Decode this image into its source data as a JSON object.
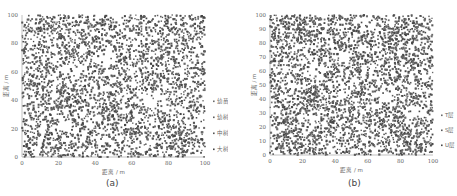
{
  "chart_data": [
    {
      "type": "scatter",
      "panel": "(a)",
      "title": "",
      "xlabel": "距离 / m",
      "ylabel": "距离 / m",
      "xlim": [
        0,
        100
      ],
      "ylim": [
        0,
        100
      ],
      "xticks": [
        "0",
        "20",
        "40",
        "60",
        "80",
        "100"
      ],
      "yticks": [
        "0",
        "20",
        "40",
        "60",
        "80",
        "100"
      ],
      "grid": false,
      "legend_position": "right",
      "series": [
        {
          "name": "幼苗",
          "color": "#6b6b6b"
        },
        {
          "name": "幼树",
          "color": "#5e5e5e"
        },
        {
          "name": "中树",
          "color": "#555555"
        },
        {
          "name": "大树",
          "color": "#444444"
        }
      ],
      "point_count_approx": 3200,
      "dense_regions": [
        {
          "x": 20,
          "y": 90,
          "r": 12
        },
        {
          "x": 80,
          "y": 85,
          "r": 14
        },
        {
          "x": 25,
          "y": 40,
          "r": 12
        },
        {
          "x": 45,
          "y": 30,
          "r": 12
        },
        {
          "x": 10,
          "y": 10,
          "r": 12
        },
        {
          "x": 85,
          "y": 10,
          "r": 12
        }
      ],
      "sparse_regions": [
        {
          "x": 28,
          "y": 60,
          "r": 8
        },
        {
          "x": 45,
          "y": 70,
          "r": 7
        },
        {
          "x": 72,
          "y": 40,
          "r": 8
        },
        {
          "x": 88,
          "y": 30,
          "r": 8
        },
        {
          "x": 25,
          "y": 20,
          "r": 6
        }
      ]
    },
    {
      "type": "scatter",
      "panel": "(b)",
      "title": "",
      "xlabel": "距离 / m",
      "ylabel": "距离 / m",
      "xlim": [
        0,
        100
      ],
      "ylim": [
        0,
        100
      ],
      "xticks": [
        "0",
        "20",
        "40",
        "60",
        "80",
        "100"
      ],
      "yticks": [
        "0",
        "10",
        "20",
        "30",
        "40",
        "50",
        "60",
        "70",
        "80",
        "90",
        "100"
      ],
      "grid": false,
      "legend_position": "right",
      "series": [
        {
          "name": "T层",
          "color": "#6b6b6b"
        },
        {
          "name": "S层",
          "color": "#5a5a5a"
        },
        {
          "name": "U层",
          "color": "#474747"
        }
      ],
      "point_count_approx": 3200,
      "dense_regions": [
        {
          "x": 20,
          "y": 90,
          "r": 12
        },
        {
          "x": 80,
          "y": 85,
          "r": 14
        },
        {
          "x": 25,
          "y": 40,
          "r": 12
        },
        {
          "x": 45,
          "y": 30,
          "r": 12
        },
        {
          "x": 10,
          "y": 10,
          "r": 12
        },
        {
          "x": 85,
          "y": 10,
          "r": 12
        }
      ],
      "sparse_regions": [
        {
          "x": 28,
          "y": 60,
          "r": 8
        },
        {
          "x": 45,
          "y": 70,
          "r": 7
        },
        {
          "x": 72,
          "y": 40,
          "r": 8
        },
        {
          "x": 88,
          "y": 30,
          "r": 8
        },
        {
          "x": 25,
          "y": 20,
          "r": 6
        }
      ]
    }
  ],
  "captions": {
    "a": "(a)",
    "b": "(b)"
  }
}
